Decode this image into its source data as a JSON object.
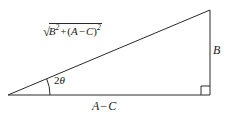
{
  "figure": {
    "background_color": "#ffffff",
    "stroke_color": "#2a2a2a",
    "text_color": "#1b1b1b"
  },
  "labels": {
    "hypotenuse": {
      "name": "hypotenuse-label",
      "full_text": "√(B² + (A − C)²)",
      "radical_sign": "√",
      "base_symbol": "B",
      "base_exponent": "2",
      "plus": "+",
      "open_paren": "(",
      "term_a": "A",
      "minus": "−",
      "term_c": "C",
      "close_paren": ")",
      "group_exponent": "2"
    },
    "vertical_side": {
      "name": "side-b-label",
      "text": "B"
    },
    "base_side": {
      "name": "base-label",
      "term_a": "A",
      "minus": "−",
      "term_c": "C",
      "text": "A − C"
    },
    "angle": {
      "name": "angle-label",
      "coefficient": "2",
      "symbol": "θ",
      "text": "2θ"
    }
  },
  "geometry": {
    "left_vertex": [
      8,
      95
    ],
    "right_vertex": [
      210,
      95
    ],
    "apex": [
      210,
      10
    ],
    "right_angle_marker_size": 9,
    "angle_arc_radius": 38
  }
}
